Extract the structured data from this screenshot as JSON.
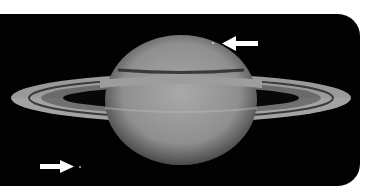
{
  "image": {
    "subject": "Saturn with rings",
    "background": "#020202",
    "page_background": "#ffffff",
    "annotations": [
      {
        "type": "arrow",
        "direction": "left",
        "points_to": "feature on upper limb of planet",
        "color": "#ffffff"
      },
      {
        "type": "arrow",
        "direction": "right",
        "points_to": "small moon lower left",
        "color": "#ffffff"
      }
    ]
  }
}
